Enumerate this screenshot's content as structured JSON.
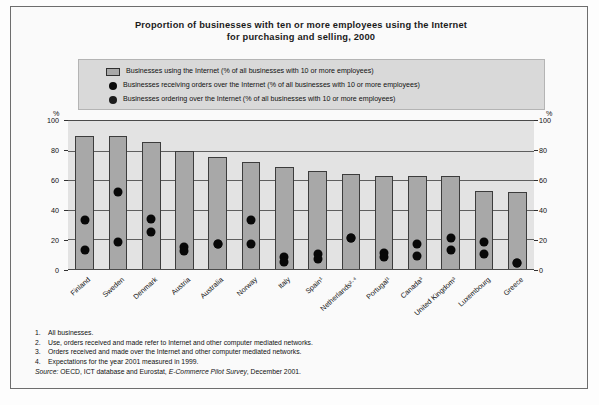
{
  "figure": {
    "title_line1": "Proportion of businesses with ten or more employees using the Internet",
    "title_line2": "for purchasing and selling, 2000"
  },
  "legend": {
    "items": [
      {
        "marker": "bar-swatch",
        "label": "Businesses using the Internet (% of all businesses with 10 or more employees)"
      },
      {
        "marker": "dot-swatch",
        "label": "Businesses receiving orders over the Internet (% of all businesses with 10 or more employees)"
      },
      {
        "marker": "dot-swatch",
        "label": "Businesses ordering over the Internet (% of all businesses with 10 or more employees)"
      }
    ]
  },
  "axes": {
    "unit_left": "%",
    "unit_right": "%",
    "ticks": [
      "100",
      "80",
      "60",
      "40",
      "20",
      "0"
    ]
  },
  "footnotes": [
    {
      "num": "1.",
      "text": "All businesses."
    },
    {
      "num": "2.",
      "text": "Use, orders received and made refer to Internet and other computer mediated networks."
    },
    {
      "num": "3.",
      "text": "Orders received and made over the Internet and other computer mediated networks."
    },
    {
      "num": "4.",
      "text": "Expectations for the year 2001 measured in 1999."
    }
  ],
  "source": {
    "label": "Source:",
    "text_before": "OECD, ICT database and Eurostat,",
    "italic": "E-Commerce Pilot Survey",
    "text_after": ", December 2001."
  },
  "chart_data": {
    "type": "bar",
    "title": "Proportion of businesses with ten or more employees using the Internet for purchasing and selling, 2000",
    "xlabel": "",
    "ylabel": "%",
    "ylim": [
      0,
      100
    ],
    "yticks": [
      0,
      20,
      40,
      60,
      80,
      100
    ],
    "grid": true,
    "legend_position": "top",
    "categories": [
      "Finland",
      "Sweden",
      "Denmark",
      "Austria",
      "Australia",
      "Norway",
      "Italy",
      "Spain¹",
      "Netherlands²·⁴",
      "Portugal¹",
      "Canada³",
      "United Kingdom³",
      "Luxembourg",
      "Greece"
    ],
    "category_footnote_marks": [
      "",
      "",
      "",
      "",
      "",
      "",
      "",
      "1",
      "2, 4",
      "1",
      "3",
      "3",
      "",
      ""
    ],
    "series": [
      {
        "name": "Businesses using the Internet (% of all businesses with 10 or more employees)",
        "type": "bar",
        "values": [
          90,
          90,
          86,
          80,
          76,
          72,
          69,
          66,
          64,
          63,
          63,
          63,
          53,
          52
        ]
      },
      {
        "name": "Businesses receiving orders over the Internet (% of all businesses with 10 or more employees)",
        "type": "scatter",
        "values": [
          33,
          52,
          34,
          15,
          17,
          33,
          8,
          10,
          21,
          11,
          17,
          21,
          18,
          4
        ]
      },
      {
        "name": "Businesses ordering over the Internet (% of all businesses with 10 or more employees)",
        "type": "scatter",
        "values": [
          13,
          18,
          25,
          12,
          17,
          17,
          5,
          7,
          21,
          8,
          9,
          13,
          10,
          4
        ]
      }
    ]
  }
}
